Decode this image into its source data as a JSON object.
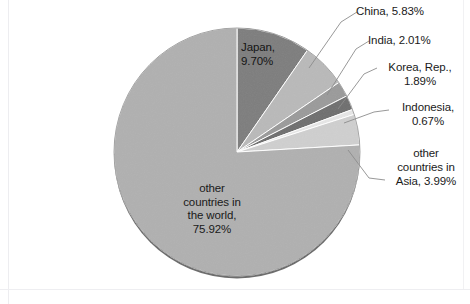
{
  "chart_data": {
    "type": "pie",
    "title": "",
    "subtitle": "",
    "xlabel": "",
    "ylabel": "",
    "legend_position": "none",
    "grid": false,
    "unit": "%",
    "start_angle_deg": 0,
    "direction": "clockwise",
    "categories": [
      "Japan",
      "China",
      "India",
      "Korea, Rep.",
      "Indonesia",
      "other countries in Asia",
      "other countries in the world"
    ],
    "values": [
      9.7,
      5.83,
      2.01,
      1.89,
      0.67,
      3.99,
      75.92
    ],
    "colors": [
      "#7d7d7d",
      "#b9b9b9",
      "#9a9a9a",
      "#6e6e6e",
      "#e6e6e6",
      "#cfcfcf",
      "#b0b0b0"
    ],
    "labels": [
      "Japan, 9.70%",
      "China, 5.83%",
      "India, 2.01%",
      "Korea, Rep., 1.89%",
      "Indonesia, 0.67%",
      "other countries in Asia, 3.99%",
      "other countries in the world, 75.92%"
    ],
    "slices": [
      {
        "name": "Japan",
        "value": 9.7,
        "color": "#7d7d7d",
        "label_text": "Japan,\n9.70%",
        "label_placement": "inside"
      },
      {
        "name": "China",
        "value": 5.83,
        "color": "#b9b9b9",
        "label_text": "China, 5.83%",
        "label_placement": "callout"
      },
      {
        "name": "India",
        "value": 2.01,
        "color": "#9a9a9a",
        "label_text": "India, 2.01%",
        "label_placement": "callout"
      },
      {
        "name": "Korea, Rep.",
        "value": 1.89,
        "color": "#6e6e6e",
        "label_text": "Korea, Rep.,\n1.89%",
        "label_placement": "callout"
      },
      {
        "name": "Indonesia",
        "value": 0.67,
        "color": "#e6e6e6",
        "label_text": "Indonesia,\n0.67%",
        "label_placement": "callout"
      },
      {
        "name": "other countries in Asia",
        "value": 3.99,
        "color": "#cfcfcf",
        "label_text": "other\ncountries in\nAsia, 3.99%",
        "label_placement": "callout"
      },
      {
        "name": "other countries in the world",
        "value": 75.92,
        "color": "#b0b0b0",
        "label_text": "other\ncountries in\nthe world,\n75.92%",
        "label_placement": "inside"
      }
    ]
  },
  "style": {
    "background": "#ffffff",
    "text_color": "#1a1a1a",
    "outline_color": "#4a4a4a",
    "leader_line_color": "#8c8c8c"
  }
}
